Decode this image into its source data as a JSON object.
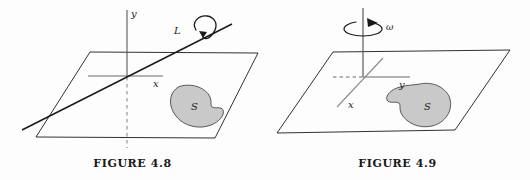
{
  "sheet": {
    "background_color": "#fdfdfd",
    "ink_color": "#1a1a1a",
    "blob_fill_color": "#c9c9c9",
    "blob_stroke_color": "#4a4a4a",
    "axis_gray_color": "#7d7d7d"
  },
  "figures": [
    {
      "id": "figure-4-8",
      "caption": "FIGURE 4.8",
      "description": "A plane containing region S, with a tilted line L passing through the plane and a curved rotation arrow around L.",
      "labels": {
        "vertical_axis": "y",
        "horizontal_axis": "x",
        "line": "L",
        "region": "S"
      }
    },
    {
      "id": "figure-4-9",
      "caption": "FIGURE 4.9",
      "description": "A horizontal plane containing region S, with a vertical axis through the origin and a circular rotation arrow labelled omega around the vertical axis.",
      "labels": {
        "vertical_rotation": "ω",
        "horizontal_axis": "y",
        "depth_axis": "x",
        "region": "S"
      }
    }
  ]
}
